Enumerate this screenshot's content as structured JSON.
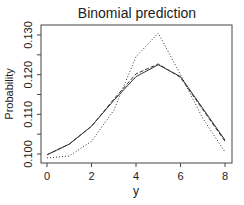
{
  "chart_data": {
    "type": "line",
    "title": "Binomial prediction",
    "xlabel": "y",
    "ylabel": "Probability",
    "x": [
      0,
      1,
      2,
      3,
      4,
      5,
      6,
      7,
      8
    ],
    "xticks": [
      "0",
      "2",
      "4",
      "6",
      "8"
    ],
    "yticks": [
      "0.100",
      "0.110",
      "0.120",
      "0.130"
    ],
    "xlim": [
      0,
      8
    ],
    "ylim": [
      0.0985,
      0.1315
    ],
    "grid": false,
    "legend": null,
    "series": [
      {
        "name": "solid",
        "style": "solid",
        "values": [
          0.0998,
          0.1025,
          0.107,
          0.1135,
          0.1195,
          0.1225,
          0.1195,
          0.1115,
          0.1035
        ]
      },
      {
        "name": "dashed",
        "style": "dashed",
        "values": [
          0.0998,
          0.1025,
          0.107,
          0.1138,
          0.1202,
          0.1227,
          0.1193,
          0.1112,
          0.1032
        ]
      },
      {
        "name": "dotted",
        "style": "dotted",
        "values": [
          0.099,
          0.0995,
          0.1032,
          0.111,
          0.1245,
          0.1305,
          0.12,
          0.109,
          0.1005
        ]
      }
    ]
  }
}
